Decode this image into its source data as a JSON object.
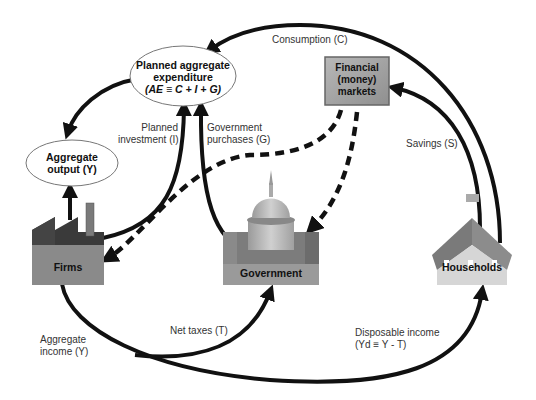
{
  "nodes": {
    "planned_ae": {
      "line1": "Planned aggregate",
      "line2": "expenditure",
      "line3": "(AE ≡ C + I + G)"
    },
    "aggregate_output": {
      "line1": "Aggregate",
      "line2": "output (Y)"
    },
    "financial_markets": {
      "line1": "Financial",
      "line2": "(money)",
      "line3": "markets"
    },
    "firms": {
      "label": "Firms"
    },
    "government": {
      "label": "Government"
    },
    "households": {
      "label": "Households"
    }
  },
  "flows": {
    "consumption": "Consumption (C)",
    "planned_investment_1": "Planned",
    "planned_investment_2": "investment (I)",
    "gov_purchases_1": "Government",
    "gov_purchases_2": "purchases (G)",
    "savings": "Savings (S)",
    "aggregate_income_1": "Aggregate",
    "aggregate_income_2": "income (Y)",
    "net_taxes": "Net taxes (T)",
    "disposable_income_1": "Disposable income",
    "disposable_income_2": "(Yd ≡ Y - T)"
  },
  "colors": {
    "arrow": "#111111",
    "firms_top": "#3a3a3a",
    "firms_body": "#8a8a8a",
    "gov_body": "#9a9a9a",
    "dome": "#b8b8b8",
    "house_roof": "#808080",
    "house_body": "#d4d4d4",
    "fin_box": "#a6a6a6"
  }
}
